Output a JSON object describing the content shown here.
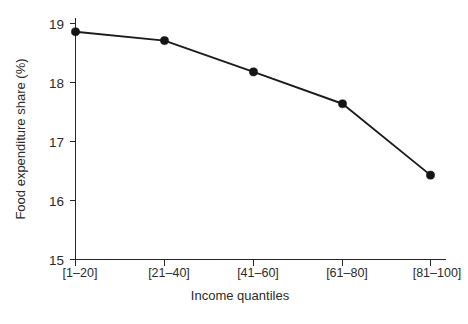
{
  "chart_data": {
    "type": "line",
    "title": "",
    "subtitle": "",
    "xlabel": "Income quantiles",
    "ylabel": "Food expenditure share (%)",
    "categories": [
      "[1–20]",
      "[21–40]",
      "[41–60]",
      "[61–80]",
      "[81–100]"
    ],
    "values": [
      18.86,
      18.71,
      18.18,
      17.64,
      16.43
    ],
    "series": [
      {
        "name": "Food expenditure share",
        "values": [
          18.86,
          18.71,
          18.18,
          17.64,
          16.43
        ]
      }
    ],
    "ylim": [
      15,
      19
    ],
    "yticks": [
      15,
      16,
      17,
      18,
      19
    ],
    "ytick_labels": [
      "15",
      "16",
      "17",
      "18",
      "19"
    ],
    "xlim": [
      0,
      6
    ],
    "grid": false,
    "legend": false,
    "legend_position": "none",
    "marker": "filled-circle",
    "line_color": "#1c1c1c",
    "marker_color": "#141414",
    "axis_color": "#262626",
    "background_color": "#ffffff",
    "annotations": []
  },
  "axes": {
    "y_title": "Food expenditure share (%)",
    "x_title": "Income quantiles",
    "y_tick_values": [
      "19",
      "18",
      "17",
      "16",
      "15"
    ],
    "x_tick_values": [
      "[1–20]",
      "[21–40]",
      "[41–60]",
      "[61–80]",
      "[81–100]"
    ]
  }
}
